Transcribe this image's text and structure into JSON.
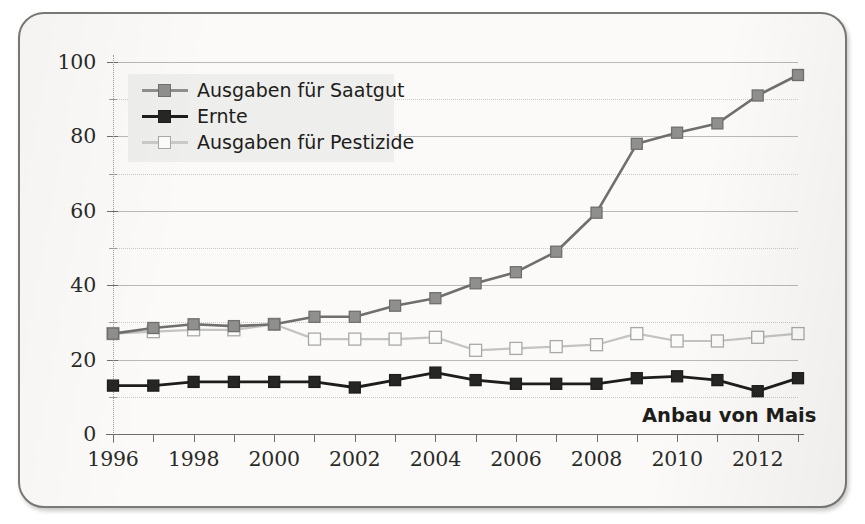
{
  "annotation": "Anbau von Mais",
  "legend": {
    "items": [
      {
        "label": "Ausgaben für Saatgut",
        "key": "saatgut"
      },
      {
        "label": "Ernte",
        "key": "ernte"
      },
      {
        "label": "Ausgaben für Pestizide",
        "key": "pestizide"
      }
    ]
  },
  "colors": {
    "saatgut_line": "#6f6f6d",
    "saatgut_fill": "#8f8f8d",
    "ernte_line": "#1d1d1b",
    "ernte_fill": "#262624",
    "pestizide_line": "#c3c3c0",
    "pestizide_fill": "#fbfbfa",
    "pestizide_stroke": "#a8a8a5",
    "grid": "#b9b9b7",
    "axis": "#6e6e6c",
    "page_bg": "#fbfaf8",
    "frame_border": "#7a7a78",
    "legend_bg": "#eeeeec",
    "text": "#1d1d1b"
  },
  "chart_data": {
    "type": "line",
    "title": "",
    "subtitle": "",
    "annotation": "Anbau von Mais",
    "xlabel": "",
    "ylabel": "",
    "xlim": [
      1996,
      2013
    ],
    "ylim": [
      0,
      100
    ],
    "grid": true,
    "grid_major_step": 20,
    "grid_minor_step": 10,
    "legend_position": "top-left",
    "x": [
      1996,
      1997,
      1998,
      1999,
      2000,
      2001,
      2002,
      2003,
      2004,
      2005,
      2006,
      2007,
      2008,
      2009,
      2010,
      2011,
      2012,
      2013
    ],
    "xtick_labels": [
      "1996",
      "",
      "1998",
      "",
      "2000",
      "",
      "2002",
      "",
      "2004",
      "",
      "2006",
      "",
      "2008",
      "",
      "2010",
      "",
      "2012",
      ""
    ],
    "ytick_labels": [
      "0",
      "20",
      "40",
      "60",
      "80",
      "100"
    ],
    "ytick_values": [
      0,
      20,
      40,
      60,
      80,
      100
    ],
    "series": [
      {
        "name": "Ausgaben für Saatgut",
        "marker": "square-filled-gray",
        "values": [
          27,
          28.5,
          29.5,
          29,
          29.5,
          31.5,
          31.5,
          34.5,
          36.5,
          40.5,
          43.5,
          49,
          59.5,
          78,
          81,
          83.5,
          91,
          96.5
        ]
      },
      {
        "name": "Ernte",
        "marker": "square-filled-black",
        "values": [
          13,
          13,
          14,
          14,
          14,
          14,
          12.5,
          14.5,
          16.5,
          14.5,
          13.5,
          13.5,
          13.5,
          15,
          15.5,
          14.5,
          11.5,
          15
        ]
      },
      {
        "name": "Ausgaben für Pestizide",
        "marker": "square-open-white",
        "values": [
          27,
          27.5,
          28,
          28,
          29.5,
          25.5,
          25.5,
          25.5,
          26,
          22.5,
          23,
          23.5,
          24,
          27,
          25,
          25,
          26,
          27
        ]
      }
    ]
  }
}
